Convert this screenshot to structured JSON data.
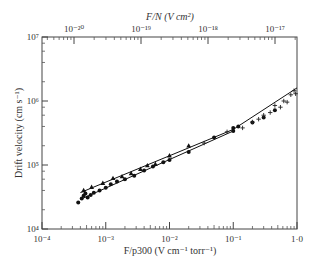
{
  "chart_data": {
    "type": "scatter",
    "title": "",
    "xlabel": "F/p300 (V cm⁻¹ torr⁻¹)",
    "ylabel": "Drift velocity (cm s⁻¹)",
    "top_xlabel": "F/N (V cm²)",
    "xscale": "log",
    "yscale": "log",
    "xlim": [
      0.0001,
      1.0
    ],
    "ylim": [
      10000,
      10000000
    ],
    "grid": false,
    "x_ticks": [
      {
        "value": 0.0001,
        "label": "10⁻⁴"
      },
      {
        "value": 0.001,
        "label": "10⁻³"
      },
      {
        "value": 0.01,
        "label": "10⁻²"
      },
      {
        "value": 0.1,
        "label": "10⁻¹"
      },
      {
        "value": 1.0,
        "label": "1·0"
      }
    ],
    "y_ticks": [
      {
        "value": 10000,
        "label": "10⁴"
      },
      {
        "value": 100000,
        "label": "10⁵"
      },
      {
        "value": 1000000,
        "label": "10⁶"
      },
      {
        "value": 10000000,
        "label": "10⁷"
      }
    ],
    "top_x_ticks": [
      {
        "value": 1e-20,
        "label": "10⁻²⁰"
      },
      {
        "value": 1e-19,
        "label": "10⁻¹⁹"
      },
      {
        "value": 1e-18,
        "label": "10⁻¹⁸"
      },
      {
        "value": 1e-17,
        "label": "10⁻¹⁷"
      }
    ],
    "series": [
      {
        "name": "dots",
        "marker": "circle",
        "points": [
          [
            0.00037,
            26000
          ],
          [
            0.00042,
            30000
          ],
          [
            0.00045,
            33000
          ],
          [
            0.00048,
            36000
          ],
          [
            0.00052,
            31000
          ],
          [
            0.00058,
            34000
          ],
          [
            0.00065,
            37000
          ],
          [
            0.0008,
            40000
          ],
          [
            0.001,
            44000
          ],
          [
            0.0012,
            50000
          ],
          [
            0.0015,
            55000
          ],
          [
            0.002,
            60000
          ],
          [
            0.0028,
            68000
          ],
          [
            0.004,
            82000
          ],
          [
            0.0055,
            95000
          ],
          [
            0.008,
            110000
          ],
          [
            0.01,
            120000
          ],
          [
            0.02,
            160000
          ],
          [
            0.05,
            270000
          ],
          [
            0.1,
            340000
          ],
          [
            0.1,
            380000
          ],
          [
            0.12,
            400000
          ],
          [
            0.2,
            460000
          ],
          [
            0.3,
            550000
          ],
          [
            0.45,
            720000
          ]
        ]
      },
      {
        "name": "triangles",
        "marker": "triangle",
        "points": [
          [
            0.00045,
            40000
          ],
          [
            0.0006,
            45000
          ],
          [
            0.0009,
            52000
          ],
          [
            0.0013,
            62000
          ],
          [
            0.0018,
            66000
          ],
          [
            0.0025,
            74000
          ],
          [
            0.0035,
            86000
          ],
          [
            0.0045,
            98000
          ],
          [
            0.006,
            103000
          ],
          [
            0.01,
            140000
          ],
          [
            0.02,
            200000
          ]
        ]
      },
      {
        "name": "crosses",
        "marker": "cross",
        "points": [
          [
            0.035,
            220000
          ],
          [
            0.08,
            330000
          ],
          [
            0.14,
            380000
          ],
          [
            0.2,
            470000
          ],
          [
            0.25,
            520000
          ],
          [
            0.3,
            600000
          ],
          [
            0.38,
            660000
          ],
          [
            0.45,
            850000
          ],
          [
            0.55,
            800000
          ],
          [
            0.62,
            1000000
          ],
          [
            0.7,
            960000
          ],
          [
            0.8,
            1250000
          ],
          [
            0.9,
            1450000
          ],
          [
            0.95,
            1300000
          ]
        ]
      }
    ],
    "fit_lines": [
      {
        "name": "upper line",
        "points": [
          [
            0.0004,
            37000
          ],
          [
            0.1,
            360000
          ],
          [
            1.0,
            1600000
          ]
        ]
      },
      {
        "name": "lower line",
        "points": [
          [
            0.0004,
            29000
          ],
          [
            0.1,
            340000
          ]
        ]
      }
    ]
  }
}
